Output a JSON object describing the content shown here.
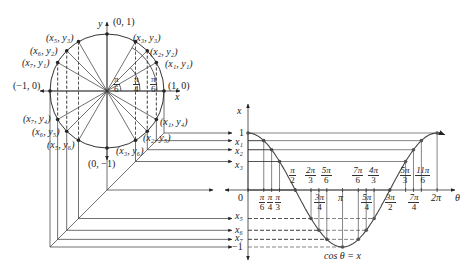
{
  "circle": {
    "axis_x_label": "x",
    "axis_y_label": "y",
    "points": {
      "top": "(0, 1)",
      "bottom": "(0, −1)",
      "left": "(−1, 0)",
      "right": "(1, 0)",
      "p1": "(x₁, y₁)",
      "p2": "(x₂, y₂)",
      "p3": "(x₃, y₃)",
      "p5": "(x₅, y₃)",
      "p6": "(x₆, y₂)",
      "p7": "(x₇, y₁)",
      "p7b": "(x₇, y₄)",
      "p6b": "(x₆, y₅)",
      "p5b": "(x₅, y₆)",
      "p1b": "(x₁, y₄)",
      "p2b": "(x₂, y₅)",
      "p3b": "(x₃, y₆)"
    },
    "angle_labels": [
      {
        "n": "π",
        "d": "6"
      },
      {
        "n": "π",
        "d": "4"
      },
      {
        "n": "π",
        "d": "6"
      }
    ]
  },
  "graph": {
    "vertical_axis_label": "x",
    "horizontal_axis_label": "θ",
    "origin_label": "0",
    "y_levels": [
      "1",
      "x₁",
      "x₂",
      "x₃",
      "x₅",
      "x₆",
      "x₇",
      "−1"
    ],
    "curve_label": "cos θ = x",
    "ticks_above": [
      {
        "n": "π",
        "d": "2"
      },
      {
        "n": "2π",
        "d": "3"
      },
      {
        "n": "5π",
        "d": "6"
      },
      {
        "n": "7π",
        "d": "6"
      },
      {
        "n": "4π",
        "d": "3"
      },
      {
        "n": "5π",
        "d": "3"
      },
      {
        "n": "11π",
        "d": "6"
      }
    ],
    "ticks_below": [
      {
        "n": "π",
        "d": "6"
      },
      {
        "n": "π",
        "d": "4"
      },
      {
        "n": "π",
        "d": "3"
      },
      {
        "n": "3π",
        "d": "4"
      },
      {
        "n": "5π",
        "d": "4"
      },
      {
        "n": "3π",
        "d": "2"
      },
      {
        "n": "7π",
        "d": "4"
      }
    ],
    "ticks_plain": [
      "π",
      "2π"
    ]
  }
}
